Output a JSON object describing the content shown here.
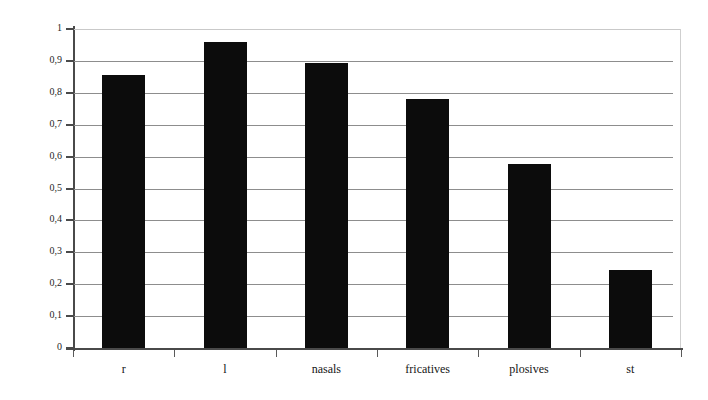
{
  "chart_data": {
    "type": "bar",
    "title": "",
    "subtitle": "",
    "xlabel": "",
    "ylabel": "mean relative frequency",
    "categories": [
      "r",
      "l",
      "nasals",
      "fricatives",
      "plosives",
      "st"
    ],
    "values": [
      0.855,
      0.96,
      0.895,
      0.78,
      0.577,
      0.245
    ],
    "series": [
      {
        "name": "mean relative frequency",
        "values": [
          0.855,
          0.96,
          0.895,
          0.78,
          0.577,
          0.245
        ]
      }
    ],
    "ylim": [
      0,
      1
    ],
    "xlim": [
      0,
      6
    ],
    "ytick_labels": [
      "0",
      "0,1",
      "0,2",
      "0,3",
      "0,4",
      "0,5",
      "0,6",
      "0,7",
      "0,8",
      "0,9",
      "1"
    ],
    "ytick_values": [
      0,
      0.1,
      0.2,
      0.3,
      0.4,
      0.5,
      0.6,
      0.7,
      0.8,
      0.9,
      1
    ],
    "grid": true,
    "grid_axis": "y",
    "legend": false,
    "legend_position": "none",
    "bar_color": "#0c0c0c",
    "gridline_color": "#8d8d8d",
    "axis_color": "#4a4a4a",
    "frame_color": "#c9c9c9",
    "background_color": "#ffffff",
    "decimal_separator": ","
  }
}
